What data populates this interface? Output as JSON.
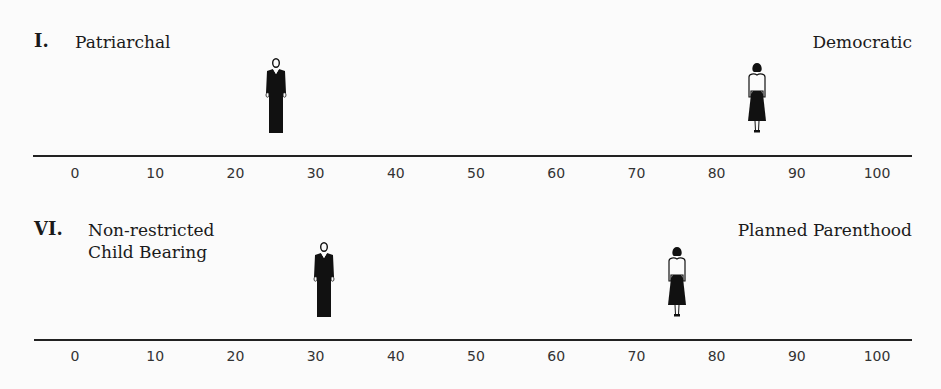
{
  "chart_data": [
    {
      "type": "scatter",
      "title": "I.",
      "left_label": "Patriarchal",
      "right_label": "Democratic",
      "xlim": [
        0,
        100
      ],
      "ticks": [
        0,
        10,
        20,
        30,
        40,
        50,
        60,
        70,
        80,
        90,
        100
      ],
      "series": [
        {
          "name": "man",
          "icon": "man-figure-icon",
          "value": 25
        },
        {
          "name": "woman",
          "icon": "woman-figure-icon",
          "value": 85
        }
      ],
      "grid": false
    },
    {
      "type": "scatter",
      "title": "VI.",
      "left_label": "Non-restricted\nChild Bearing",
      "right_label": "Planned Parenthood",
      "xlim": [
        0,
        100
      ],
      "ticks": [
        0,
        10,
        20,
        30,
        40,
        50,
        60,
        70,
        80,
        90,
        100
      ],
      "series": [
        {
          "name": "man",
          "icon": "man-figure-icon",
          "value": 31
        },
        {
          "name": "woman",
          "icon": "woman-figure-icon",
          "value": 75
        }
      ],
      "grid": false
    }
  ],
  "panels": [
    {
      "roman": "I.",
      "left_label": "Patriarchal",
      "right_label": "Democratic",
      "ticks": [
        "0",
        "10",
        "20",
        "30",
        "40",
        "50",
        "60",
        "70",
        "80",
        "90",
        "100"
      ],
      "man_value": 25,
      "woman_value": 85
    },
    {
      "roman": "VI.",
      "left_label": "Non-restricted\nChild Bearing",
      "right_label": "Planned Parenthood",
      "ticks": [
        "0",
        "10",
        "20",
        "30",
        "40",
        "50",
        "60",
        "70",
        "80",
        "90",
        "100"
      ],
      "man_value": 31,
      "woman_value": 75
    }
  ],
  "colors": {
    "ink": "#1a1a1a",
    "background": "#fbfbfb"
  }
}
